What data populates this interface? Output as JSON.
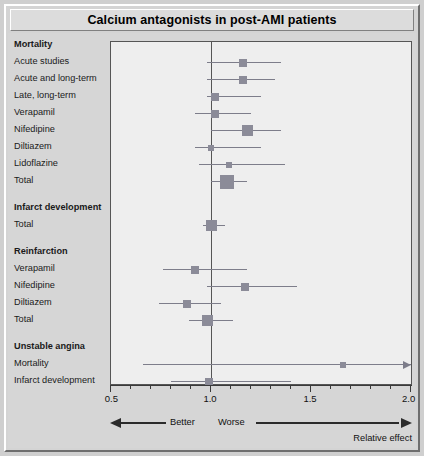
{
  "title": "Calcium antagonists in post-AMI patients",
  "axis": {
    "min": 0.5,
    "max": 2.0,
    "tick_labels": [
      "0.5",
      "1.0",
      "1.5",
      "2.0"
    ],
    "tick_values": [
      0.5,
      1.0,
      1.5,
      2.0
    ],
    "minor_step": 0.1,
    "reference_line": 1.0
  },
  "direction": {
    "better_label": "Better",
    "worse_label": "Worse",
    "axis_title": "Relative effect"
  },
  "chart_data": {
    "type": "scatter",
    "subtype": "forest-plot",
    "title": "Calcium antagonists in post-AMI patients",
    "xlabel": "Relative effect",
    "ylabel": "",
    "xlim": [
      0.5,
      2.0
    ],
    "grid": false,
    "legend": "none",
    "reference_line": 1.0,
    "groups": [
      {
        "name": "Mortality",
        "rows": [
          {
            "label": "Acute studies",
            "estimate": 1.16,
            "ci_low": 0.98,
            "ci_high": 1.35,
            "weight": 2,
            "arrow_right": false
          },
          {
            "label": "Acute and long-term",
            "estimate": 1.16,
            "ci_low": 0.98,
            "ci_high": 1.32,
            "weight": 2,
            "arrow_right": false
          },
          {
            "label": "Late, long-term",
            "estimate": 1.02,
            "ci_low": 0.98,
            "ci_high": 1.25,
            "weight": 2,
            "arrow_right": false
          },
          {
            "label": "Verapamil",
            "estimate": 1.02,
            "ci_low": 0.92,
            "ci_high": 1.2,
            "weight": 2,
            "arrow_right": false
          },
          {
            "label": "Nifedipine",
            "estimate": 1.18,
            "ci_low": 1.0,
            "ci_high": 1.35,
            "weight": 3,
            "arrow_right": false
          },
          {
            "label": "Diltiazem",
            "estimate": 1.0,
            "ci_low": 0.92,
            "ci_high": 1.25,
            "weight": 1,
            "arrow_right": false
          },
          {
            "label": "Lidoflazine",
            "estimate": 1.09,
            "ci_low": 0.94,
            "ci_high": 1.37,
            "weight": 1,
            "arrow_right": false
          },
          {
            "label": "Total",
            "estimate": 1.08,
            "ci_low": 1.0,
            "ci_high": 1.18,
            "weight": 4,
            "arrow_right": false
          }
        ]
      },
      {
        "name": "Infarct development",
        "rows": [
          {
            "label": "Total",
            "estimate": 1.0,
            "ci_low": 0.96,
            "ci_high": 1.07,
            "weight": 3,
            "arrow_right": false
          }
        ]
      },
      {
        "name": "Reinfarction",
        "rows": [
          {
            "label": "Verapamil",
            "estimate": 0.92,
            "ci_low": 0.76,
            "ci_high": 1.18,
            "weight": 2,
            "arrow_right": false
          },
          {
            "label": "Nifedipine",
            "estimate": 1.17,
            "ci_low": 0.98,
            "ci_high": 1.43,
            "weight": 2,
            "arrow_right": false
          },
          {
            "label": "Diltiazem",
            "estimate": 0.88,
            "ci_low": 0.74,
            "ci_high": 1.05,
            "weight": 2,
            "arrow_right": false
          },
          {
            "label": "Total",
            "estimate": 0.98,
            "ci_low": 0.89,
            "ci_high": 1.11,
            "weight": 3,
            "arrow_right": false
          }
        ]
      },
      {
        "name": "Unstable angina",
        "rows": [
          {
            "label": "Mortality",
            "estimate": 1.66,
            "ci_low": 0.66,
            "ci_high": 2.0,
            "weight": 1,
            "arrow_right": true
          },
          {
            "label": "Infarct development",
            "estimate": 0.99,
            "ci_low": 0.8,
            "ci_high": 1.4,
            "weight": 2,
            "arrow_right": false
          }
        ]
      }
    ]
  },
  "colors": {
    "marker": "#8b8b98",
    "ci_line": "#7d7d8a",
    "plot_bg": "#eeeeee",
    "panel_bg": "#d6d6d6",
    "frame": "#555555",
    "text": "#111111"
  }
}
